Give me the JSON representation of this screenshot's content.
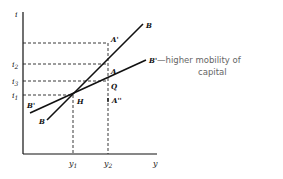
{
  "diagram": {
    "type": "IS-LM-BP style economics diagram",
    "axes": {
      "y_axis_label": "i",
      "x_axis_label": "y"
    },
    "y_ticks": [
      {
        "label": "i",
        "sub": "2",
        "level": "i2"
      },
      {
        "label": "i",
        "sub": "3",
        "level": "i3"
      },
      {
        "label": "i",
        "sub": "1",
        "level": "i1"
      }
    ],
    "x_ticks": [
      {
        "label": "y",
        "sub": "1"
      },
      {
        "label": "y",
        "sub": "2"
      }
    ],
    "curves": [
      {
        "name": "BB",
        "start_label": "B",
        "end_label": "B"
      },
      {
        "name": "B'B'",
        "start_label": "B'",
        "end_label": "B'"
      }
    ],
    "points": {
      "H": "H",
      "A": "A",
      "A_prime": "A'",
      "A_double_prime": "A''",
      "Q": "Q"
    },
    "annotation": {
      "line1": "—higher mobility of",
      "line2": "capital"
    }
  }
}
